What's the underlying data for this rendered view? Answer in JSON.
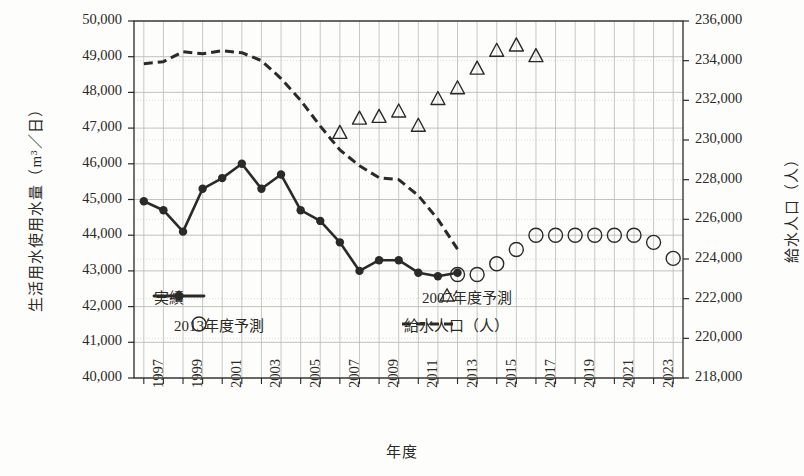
{
  "chart_data": {
    "type": "line",
    "title": "",
    "xlabel": "年度",
    "ylabel": "生活用水使用水量（m³／日）",
    "ylabel_right": "給水人口（人）",
    "ylim": [
      40000,
      50000
    ],
    "ylim_right": [
      218000,
      236000
    ],
    "xlim": [
      1996.5,
      2024.5
    ],
    "grid": true,
    "legend_position": "inside-bottom",
    "yticks_left": [
      "40,000",
      "41,000",
      "42,000",
      "43,000",
      "44,000",
      "45,000",
      "46,000",
      "47,000",
      "48,000",
      "49,000",
      "50,000"
    ],
    "yticks_right": [
      "218,000",
      "220,000",
      "222,000",
      "224,000",
      "226,000",
      "228,000",
      "230,000",
      "232,000",
      "234,000",
      "236,000"
    ],
    "xticks": [
      "1997",
      "1999",
      "2001",
      "2003",
      "2005",
      "2007",
      "2009",
      "2011",
      "2013",
      "2015",
      "2017",
      "2019",
      "2021",
      "2023"
    ],
    "series": [
      {
        "name": "実績",
        "marker": "filled-circle",
        "line": "solid",
        "axis": "left",
        "x": [
          1997,
          1998,
          1999,
          2000,
          2001,
          2002,
          2003,
          2004,
          2005,
          2006,
          2007,
          2008,
          2009,
          2010,
          2011,
          2012,
          2013
        ],
        "values": [
          44950,
          44700,
          44100,
          45300,
          45600,
          46000,
          45300,
          45700,
          44700,
          44400,
          43800,
          43000,
          43300,
          43300,
          42950,
          42850,
          42950
        ]
      },
      {
        "name": "2007年度予測",
        "marker": "open-triangle",
        "line": "none",
        "axis": "left",
        "x": [
          2007,
          2008,
          2009,
          2010,
          2011,
          2012,
          2013,
          2014,
          2015,
          2016,
          2017
        ],
        "values": [
          46850,
          47250,
          47300,
          47450,
          47050,
          47800,
          48100,
          48650,
          49150,
          49300,
          49000
        ]
      },
      {
        "name": "2013年度予測",
        "marker": "open-circle",
        "line": "none",
        "axis": "left",
        "x": [
          2013,
          2014,
          2015,
          2016,
          2017,
          2018,
          2019,
          2020,
          2021,
          2022,
          2023,
          2024
        ],
        "values": [
          42900,
          42900,
          43200,
          43600,
          44000,
          44000,
          44000,
          44000,
          44000,
          44000,
          43800,
          43350
        ]
      },
      {
        "name": "給水人口（人）",
        "marker": "none",
        "line": "dashed",
        "axis": "right",
        "x": [
          1997,
          1998,
          1999,
          2000,
          2001,
          2002,
          2003,
          2004,
          2005,
          2006,
          2007,
          2008,
          2009,
          2010,
          2011,
          2012,
          2013
        ],
        "values": [
          233850,
          233950,
          234450,
          234350,
          234500,
          234400,
          234000,
          233100,
          232000,
          230700,
          229500,
          228700,
          228100,
          228000,
          227200,
          226000,
          224500
        ]
      }
    ],
    "legend": [
      {
        "label": "実績",
        "marker": "filled-circle-line"
      },
      {
        "label": "2007年度予測",
        "marker": "open-triangle"
      },
      {
        "label": "2013年度予測",
        "marker": "open-circle"
      },
      {
        "label": "給水人口（人）",
        "marker": "dashed-line"
      }
    ],
    "colors": {
      "ink": "#2b2a26",
      "grid": "#b9bdb2",
      "grid_minor": "#ccd0c6",
      "background": "#fdfdfb"
    }
  }
}
